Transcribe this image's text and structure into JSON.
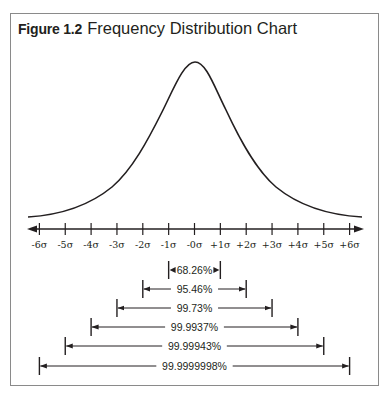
{
  "figure": {
    "number": "Figure 1.2",
    "title": "Frequency Distribution Chart"
  },
  "chart_data": {
    "type": "line",
    "title": "Frequency Distribution Chart",
    "figure_label": "Figure 1.2",
    "xlabel": "",
    "ylabel": "",
    "grid": false,
    "legend": "none",
    "x_tick_labels": [
      "-6σ",
      "-5σ",
      "-4σ",
      "-3σ",
      "-2σ",
      "-1σ",
      "-0σ",
      "+1σ",
      "+2σ",
      "+3σ",
      "+4σ",
      "+5σ",
      "+6σ"
    ],
    "x_ticks": [
      -6,
      -5,
      -4,
      -3,
      -2,
      -1,
      0,
      1,
      2,
      3,
      4,
      5,
      6
    ],
    "xlim": [
      -6.5,
      6.5
    ],
    "curve": "bell curve (frequency distribution) centered at 0σ",
    "series": [
      {
        "name": "frequency",
        "x": [
          -6.5,
          -5,
          -4,
          -3,
          -2,
          -1.5,
          -1,
          -0.5,
          0,
          0.5,
          1,
          1.5,
          2,
          3,
          4,
          5,
          6.5
        ],
        "values": [
          0.01,
          0.05,
          0.12,
          0.22,
          0.38,
          0.5,
          0.66,
          0.88,
          1.0,
          0.88,
          0.66,
          0.5,
          0.38,
          0.22,
          0.12,
          0.05,
          0.01
        ]
      }
    ],
    "intervals": [
      {
        "range": "±1σ",
        "from": -1,
        "to": 1,
        "label": "68.26%"
      },
      {
        "range": "±2σ",
        "from": -2,
        "to": 2,
        "label": "95.46%"
      },
      {
        "range": "±3σ",
        "from": -3,
        "to": 3,
        "label": "99.73%"
      },
      {
        "range": "±4σ",
        "from": -4,
        "to": 4,
        "label": "99.9937%"
      },
      {
        "range": "±5σ",
        "from": -5,
        "to": 5,
        "label": "99.99943%"
      },
      {
        "range": "±6σ",
        "from": -6,
        "to": 6,
        "label": "99.9999998%"
      }
    ]
  },
  "colors": {
    "ink": "#231f20",
    "frame": "#8a8a8a",
    "background": "#ffffff"
  }
}
